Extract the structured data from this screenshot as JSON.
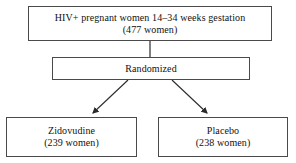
{
  "diagram": {
    "background_color": "#ffffff",
    "line_color": "#4a4a4a",
    "text_color": "#111111",
    "nodes": [
      {
        "id": "enrollment",
        "line1": "HIV+ pregnant women 14–34 weeks gestation",
        "line2": "(477 women)"
      },
      {
        "id": "randomized",
        "line1": "Randomized"
      },
      {
        "id": "zidovudine",
        "line1": "Zidovudine",
        "line2": "(239 women)"
      },
      {
        "id": "placebo",
        "line1": "Placebo",
        "line2": "(238 women)"
      }
    ],
    "connectors": [
      {
        "id": "enrollment-to-randomized",
        "from": "enrollment",
        "to": "randomized",
        "arrowhead": false
      },
      {
        "id": "randomized-to-zidovudine",
        "from": "randomized",
        "to": "zidovudine",
        "arrowhead": true
      },
      {
        "id": "randomized-to-placebo",
        "from": "randomized",
        "to": "placebo",
        "arrowhead": true
      }
    ]
  }
}
